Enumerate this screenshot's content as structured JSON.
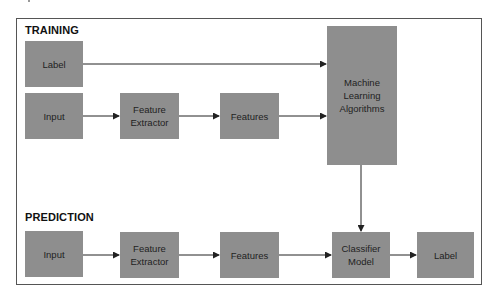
{
  "diagram": {
    "training": {
      "title": "TRAINING",
      "nodes": {
        "label": "Label",
        "input": "Input",
        "feature_extractor": "Feature\nExtractor",
        "features": "Features",
        "ml_algorithms": "Machine\nLearning\nAlgorithms"
      }
    },
    "prediction": {
      "title": "PREDICTION",
      "nodes": {
        "input": "Input",
        "feature_extractor": "Feature\nExtractor",
        "features": "Features",
        "classifier_model": "Classifier\nModel",
        "label": "Label"
      }
    },
    "edges": [
      {
        "from": "training.label",
        "to": "training.ml_algorithms"
      },
      {
        "from": "training.input",
        "to": "training.feature_extractor"
      },
      {
        "from": "training.feature_extractor",
        "to": "training.features"
      },
      {
        "from": "training.features",
        "to": "training.ml_algorithms"
      },
      {
        "from": "training.ml_algorithms",
        "to": "prediction.classifier_model"
      },
      {
        "from": "prediction.input",
        "to": "prediction.feature_extractor"
      },
      {
        "from": "prediction.feature_extractor",
        "to": "prediction.features"
      },
      {
        "from": "prediction.features",
        "to": "prediction.classifier_model"
      },
      {
        "from": "prediction.classifier_model",
        "to": "prediction.label"
      }
    ],
    "colors": {
      "box_fill": "#8e8e8e",
      "box_text": "#222222",
      "line": "#222222",
      "frame": "#555555"
    }
  }
}
